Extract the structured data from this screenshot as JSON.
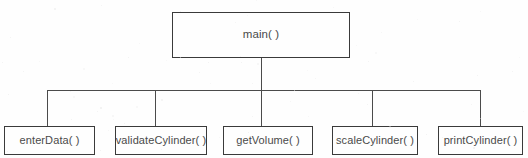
{
  "diagram": {
    "type": "structure-chart",
    "title": "",
    "root": {
      "label": "main( )",
      "x": 172,
      "y": 12,
      "width": 178,
      "height": 46
    },
    "children": [
      {
        "label": "enterData( )",
        "x": 4,
        "y": 126,
        "width": 91,
        "height": 29,
        "connector_x": 47
      },
      {
        "label": "validateCylinder( )",
        "x": 115,
        "y": 126,
        "width": 92,
        "height": 29,
        "connector_x": 155
      },
      {
        "label": "getVolume( )",
        "x": 223,
        "y": 126,
        "width": 90,
        "height": 29,
        "connector_x": 261
      },
      {
        "label": "scaleCylinder( )",
        "x": 332,
        "y": 126,
        "width": 86,
        "height": 29,
        "connector_x": 372
      },
      {
        "label": "printCylinder( )",
        "x": 438,
        "y": 126,
        "width": 85,
        "height": 29,
        "connector_x": 480
      }
    ],
    "bus": {
      "y": 90,
      "x_start": 47,
      "x_end": 480,
      "stem_x": 261,
      "stem_top": 58,
      "stem_bottom": 126
    },
    "colors": {
      "background": "#fefefe",
      "box_border": "#3a3a3a",
      "line": "#4b4b4b",
      "text": "#4a4a4a"
    }
  }
}
